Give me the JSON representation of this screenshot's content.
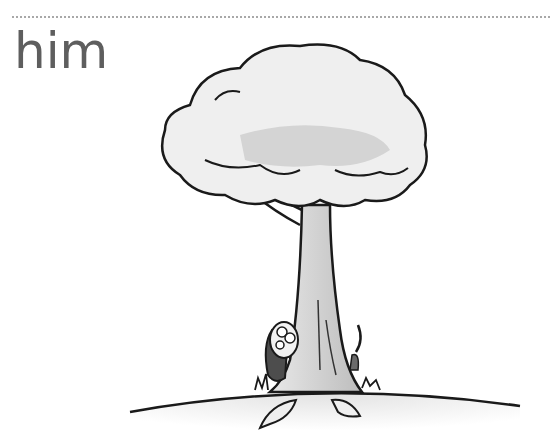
{
  "flashcard": {
    "word": "him",
    "illustration": {
      "subject": "tree",
      "character": "dog peeking from behind tree trunk",
      "details": [
        "falling leaves",
        "grass tufts",
        "hill ground"
      ]
    }
  }
}
